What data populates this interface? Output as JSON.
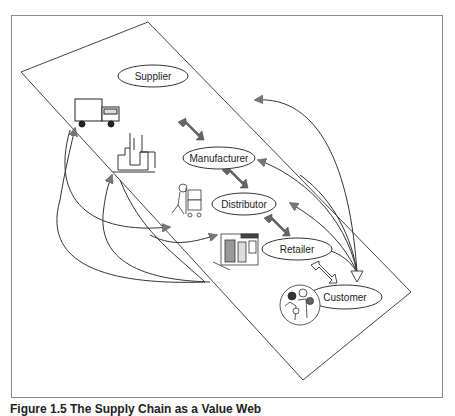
{
  "figure": {
    "caption": "Figure 1.5 The Supply Chain as a Value Web",
    "nodes": [
      {
        "id": "supplier",
        "label": "Supplier",
        "icon": "truck-icon"
      },
      {
        "id": "manufacturer",
        "label": "Manufacturer",
        "icon": "factory-icon"
      },
      {
        "id": "distributor",
        "label": "Distributor",
        "icon": "delivery-worker-icon"
      },
      {
        "id": "retailer",
        "label": "Retailer",
        "icon": "storefront-icon"
      },
      {
        "id": "customer",
        "label": "Customer",
        "icon": "people-group-icon"
      }
    ],
    "links": [
      {
        "from": "supplier",
        "to": "manufacturer",
        "type": "bidirectional",
        "style": "filled"
      },
      {
        "from": "manufacturer",
        "to": "distributor",
        "type": "bidirectional",
        "style": "filled"
      },
      {
        "from": "distributor",
        "to": "retailer",
        "type": "bidirectional",
        "style": "filled"
      },
      {
        "from": "retailer",
        "to": "customer",
        "type": "bidirectional",
        "style": "outline"
      }
    ],
    "colors": {
      "line": "#333333",
      "arrow_fill": "#666666",
      "frame": "#888888"
    }
  }
}
